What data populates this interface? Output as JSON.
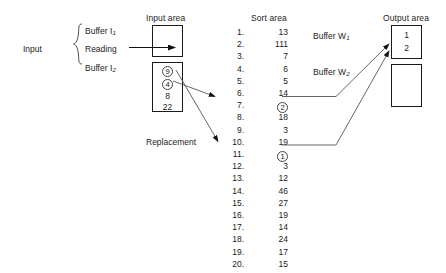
{
  "diagram": {
    "title_input_area": "Input area",
    "title_sort_area": "Sort area",
    "title_output_area": "Output area"
  },
  "input_group": {
    "label": "Input",
    "buffer1_text": "Buffer I",
    "buffer1_sub": "1",
    "reading_label": "Reading",
    "buffer2_text": "Buffer I",
    "buffer2_sub": "2"
  },
  "input_area": {
    "buffer_top": {
      "values": []
    },
    "buffer_bottom": {
      "values": [
        {
          "text": "9",
          "circled": true
        },
        {
          "text": "4",
          "circled": true
        },
        {
          "text": "8",
          "circled": false
        },
        {
          "text": "22",
          "circled": false
        }
      ]
    }
  },
  "replacement_label": "Replacement",
  "sort_area": {
    "rows": [
      {
        "index": "1.",
        "value": "13",
        "circled": false
      },
      {
        "index": "2.",
        "value": "111",
        "circled": false
      },
      {
        "index": "3.",
        "value": "7",
        "circled": false
      },
      {
        "index": "4.",
        "value": "6",
        "circled": false
      },
      {
        "index": "5.",
        "value": "5",
        "circled": false
      },
      {
        "index": "6.",
        "value": "14",
        "circled": false
      },
      {
        "index": "7.",
        "value": "2",
        "circled": true
      },
      {
        "index": "8.",
        "value": "18",
        "circled": false
      },
      {
        "index": "9.",
        "value": "3",
        "circled": false
      },
      {
        "index": "10.",
        "value": "19",
        "circled": false
      },
      {
        "index": "11.",
        "value": "1",
        "circled": true
      },
      {
        "index": "12.",
        "value": "3",
        "circled": false
      },
      {
        "index": "13.",
        "value": "12",
        "circled": false
      },
      {
        "index": "14.",
        "value": "46",
        "circled": false
      },
      {
        "index": "15.",
        "value": "27",
        "circled": false
      },
      {
        "index": "16.",
        "value": "19",
        "circled": false
      },
      {
        "index": "17.",
        "value": "14",
        "circled": false
      },
      {
        "index": "18.",
        "value": "24",
        "circled": false
      },
      {
        "index": "19.",
        "value": "17",
        "circled": false
      },
      {
        "index": "20.",
        "value": "15",
        "circled": false
      }
    ]
  },
  "write_buffers": {
    "w1_text": "Buffer W",
    "w1_sub": "1",
    "w2_text": "Buffer W",
    "w2_sub": "2"
  },
  "output_area": {
    "buffer_top": {
      "values": [
        "1",
        "2"
      ]
    },
    "buffer_bottom": {
      "values": []
    }
  },
  "colors": {
    "stroke": "#1a1a1a",
    "line": "#555555",
    "text": "#1a1a1a",
    "background": "#ffffff"
  }
}
